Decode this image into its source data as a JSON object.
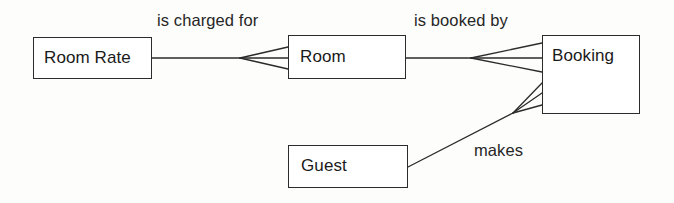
{
  "diagram": {
    "type": "entity-relationship-diagram",
    "notation": "crows-foot",
    "title": "",
    "background_color": "#fdfdfc",
    "line_color": "#2b2b2b",
    "text_color": "#1a1a1a",
    "entities": [
      {
        "id": "room-rate",
        "label": "Room Rate"
      },
      {
        "id": "room",
        "label": "Room"
      },
      {
        "id": "booking",
        "label": "Booking"
      },
      {
        "id": "guest",
        "label": "Guest"
      }
    ],
    "relationships": [
      {
        "id": "is-charged-for",
        "label": "is charged for",
        "from": "Room Rate",
        "to": "Room",
        "from_cardinality": "one",
        "to_cardinality": "many"
      },
      {
        "id": "is-booked-by",
        "label": "is booked by",
        "from": "Room",
        "to": "Booking",
        "from_cardinality": "one",
        "to_cardinality": "many"
      },
      {
        "id": "makes",
        "label": "makes",
        "from": "Guest",
        "to": "Booking",
        "from_cardinality": "one",
        "to_cardinality": "many"
      }
    ]
  }
}
